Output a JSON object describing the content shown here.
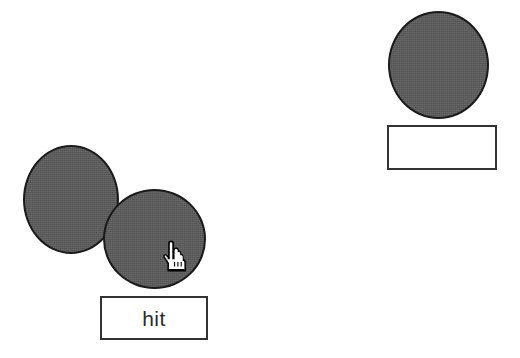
{
  "canvas": {
    "width": 520,
    "height": 358,
    "background_color": "#ffffff"
  },
  "theme": {
    "shape_fill": "#5b5b5b",
    "shape_outline": "#1a1a1a",
    "box_fill": "#ffffff",
    "box_border": "#333333",
    "text_color": "#2b2b2b"
  },
  "groups": [
    {
      "id": "left",
      "name": "overlapping-pair",
      "shapes": [
        {
          "name": "target-circle",
          "shape": "circle",
          "x": 23,
          "y": 145,
          "width": 96,
          "height": 109,
          "fill": "#5b5b5b"
        },
        {
          "name": "draggable-circle",
          "shape": "circle",
          "x": 103,
          "y": 189,
          "width": 103,
          "height": 100,
          "fill": "#5b5b5b"
        }
      ],
      "status": {
        "label": "hit",
        "x": 100,
        "y": 296,
        "width": 108,
        "height": 44
      }
    },
    {
      "id": "right",
      "name": "single-circle",
      "shapes": [
        {
          "name": "target-circle",
          "shape": "circle",
          "x": 388,
          "y": 11,
          "width": 101,
          "height": 108,
          "fill": "#5b5b5b"
        }
      ],
      "status": {
        "label": "",
        "x": 387,
        "y": 125,
        "width": 110,
        "height": 45
      }
    }
  ],
  "cursor": {
    "icon": "pointing-hand-cursor",
    "x": 163,
    "y": 240
  }
}
